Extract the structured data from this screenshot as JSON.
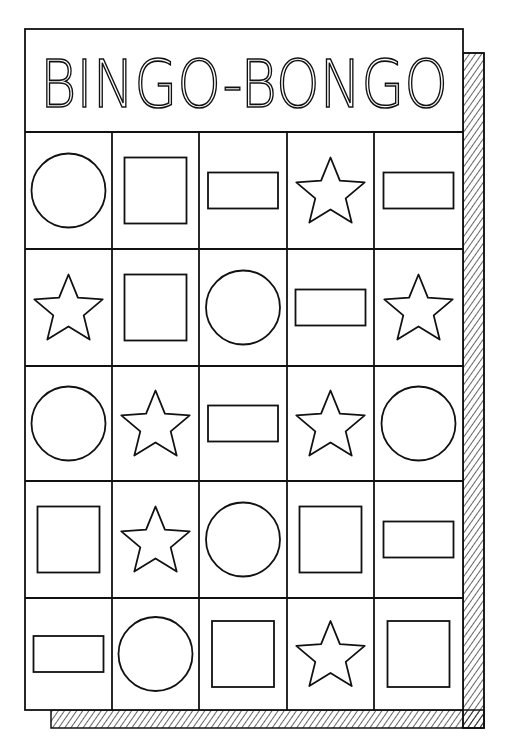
{
  "card": {
    "title": "BINGO-BONGO",
    "colors": {
      "ink": "#111111",
      "paper": "#ffffff"
    },
    "columns": 5,
    "rows": 5
  },
  "grid": [
    [
      "circle",
      "square",
      "rectangle",
      "star",
      "rectangle"
    ],
    [
      "star",
      "square",
      "circle",
      "rectangle",
      "star"
    ],
    [
      "circle",
      "star",
      "rectangle",
      "star",
      "circle"
    ],
    [
      "square",
      "star",
      "circle",
      "square",
      "rectangle"
    ],
    [
      "rectangle",
      "circle",
      "square",
      "star",
      "square"
    ]
  ]
}
